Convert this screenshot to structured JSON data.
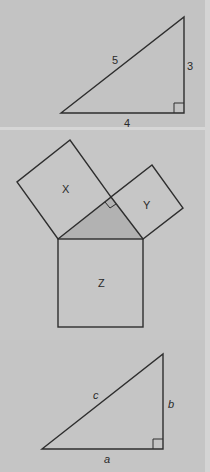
{
  "figure": {
    "type": "pythagorean-theorem-illustration",
    "colors": {
      "background": "#c4c4c4",
      "stroke": "#2e2e2e",
      "shaded_triangle": "#b2b2b2",
      "separator": "#d6d6d6"
    },
    "panels": [
      {
        "id": "numeric-triangle",
        "description": "Right triangle with sides 3, 4, 5",
        "vertices": {
          "left": [
            61,
            113
          ],
          "top": [
            184,
            17
          ],
          "right_angle": [
            184,
            113
          ]
        },
        "labels": {
          "hypotenuse": {
            "text": "5",
            "x": 116,
            "y": 64
          },
          "vertical_leg": {
            "text": "3",
            "x": 191,
            "y": 70
          },
          "horizontal_leg": {
            "text": "4",
            "x": 127,
            "y": 126
          }
        }
      },
      {
        "id": "squares-on-sides",
        "description": "Right triangle with squares X, Y on legs and Z on hypotenuse",
        "triangle": {
          "left": [
            58,
            239
          ],
          "right": [
            143,
            239
          ],
          "apex": [
            111,
            197
          ]
        },
        "squares": [
          {
            "label": "X",
            "points": [
              [
                58,
                239
              ],
              [
                111,
                197
              ],
              [
                70,
                140
              ],
              [
                17,
                182
              ]
            ],
            "label_pos": [
              66,
              193
            ]
          },
          {
            "label": "Y",
            "points": [
              [
                111,
                197
              ],
              [
                143,
                239
              ],
              [
                183,
                208
              ],
              [
                152,
                165
              ]
            ],
            "label_pos": [
              147,
              208
            ]
          },
          {
            "label": "Z",
            "points": [
              [
                58,
                239
              ],
              [
                143,
                239
              ],
              [
                143,
                327
              ],
              [
                58,
                327
              ]
            ],
            "label_pos": [
              102,
              287
            ]
          }
        ]
      },
      {
        "id": "symbolic-triangle",
        "description": "Right triangle with sides a, b, c",
        "vertices": {
          "left": [
            42,
            449
          ],
          "top": [
            163,
            354
          ],
          "right_angle": [
            163,
            449
          ]
        },
        "labels": {
          "hypotenuse": {
            "text": "c",
            "x": 96,
            "y": 399
          },
          "vertical_leg": {
            "text": "b",
            "x": 171,
            "y": 408
          },
          "horizontal_leg": {
            "text": "a",
            "x": 107,
            "y": 462
          }
        }
      }
    ]
  },
  "labels": {
    "side_5": "5",
    "side_3": "3",
    "side_4": "4",
    "square_x": "X",
    "square_y": "Y",
    "square_z": "Z",
    "side_c": "c",
    "side_b": "b",
    "side_a": "a"
  }
}
